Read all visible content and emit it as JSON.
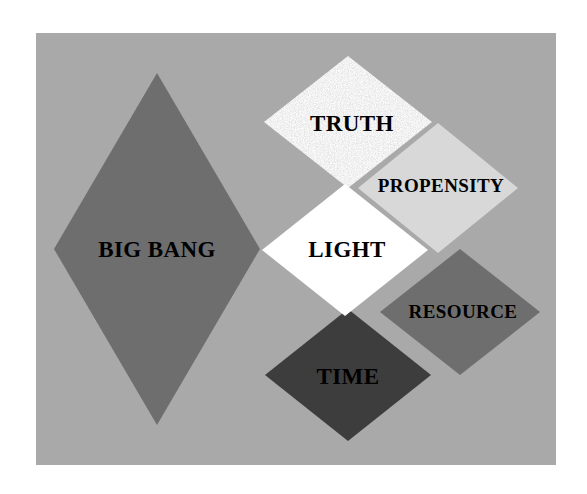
{
  "figure": {
    "type": "rhombus-overlap-diagram",
    "canvas": {
      "width": 587,
      "height": 494,
      "background": "#ffffff"
    },
    "panel": {
      "x": 36,
      "y": 33,
      "width": 520,
      "height": 432,
      "color": "#a9a9a9"
    }
  },
  "shapes": [
    {
      "id": "big-bang",
      "label": "BIG BANG",
      "fill": "#6e6e6e",
      "fill_kind": "solid",
      "center_x": 157,
      "center_y": 249,
      "half_width": 103,
      "half_height": 176
    },
    {
      "id": "truth",
      "label": "TRUTH",
      "fill": "#c9c9c9",
      "fill_kind": "speckled-noise",
      "speckle_color": "#f2f2f2",
      "center_x": 348,
      "center_y": 122,
      "half_width": 84,
      "half_height": 66
    },
    {
      "id": "propensity",
      "label": "PROPENSITY",
      "fill": "#d8d8d8",
      "fill_kind": "solid",
      "center_x": 438,
      "center_y": 188,
      "half_width": 80,
      "half_height": 65
    },
    {
      "id": "light",
      "label": "LIGHT",
      "fill": "#ffffff",
      "fill_kind": "solid",
      "center_x": 345,
      "center_y": 250,
      "half_width": 83,
      "half_height": 66
    },
    {
      "id": "resource",
      "label": "RESOURCE",
      "fill": "#6e6e6e",
      "fill_kind": "solid",
      "center_x": 460,
      "center_y": 312,
      "half_width": 80,
      "half_height": 63
    },
    {
      "id": "time",
      "label": "TIME",
      "fill": "#3d3d3d",
      "fill_kind": "solid",
      "center_x": 348,
      "center_y": 375,
      "half_width": 83,
      "half_height": 66
    }
  ],
  "labels": {
    "big_bang": "BIG BANG",
    "truth": "TRUTH",
    "propensity": "PROPENSITY",
    "light": "LIGHT",
    "resource": "RESOURCE",
    "time": "TIME"
  },
  "colors": {
    "background": "#ffffff",
    "panel": "#a9a9a9",
    "dark_gray": "#6e6e6e",
    "darkest_gray": "#3d3d3d",
    "light_gray": "#d8d8d8",
    "textured_gray": "#c9c9c9",
    "white": "#ffffff",
    "text": "#000000"
  }
}
